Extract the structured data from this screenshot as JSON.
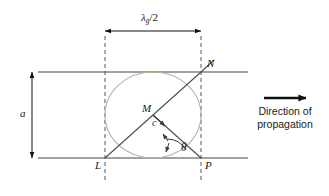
{
  "figure": {
    "labels": {
      "guide_wavelength_half": "λ",
      "guide_wavelength_sub": "g",
      "guide_wavelength_tail": "/2",
      "guide_width": "a",
      "point_L": "L",
      "point_N": "N",
      "point_P": "P",
      "point_M": "M",
      "point_C": "c",
      "angle_theta": "θ",
      "direction_line1": "Direction of",
      "direction_line2": "propagation"
    },
    "colors": {
      "wall": "#444444",
      "ray": "#4d4d4d",
      "ellipse": "#b9b098",
      "dashed": "#555555",
      "arrow": "#111111",
      "text": "#1a1a1a"
    },
    "geometry": {
      "top_wall_y": 72,
      "bottom_wall_y": 158,
      "left_dash_x": 105,
      "right_dash_x": 201,
      "wall_left_x": 38,
      "wall_right_x": 248,
      "dim_arrow_y": 31,
      "vert_dim_x": 32,
      "ellipse_cx": 153,
      "ellipse_cy": 115,
      "ellipse_rx": 48,
      "ellipse_ry": 43
    }
  }
}
